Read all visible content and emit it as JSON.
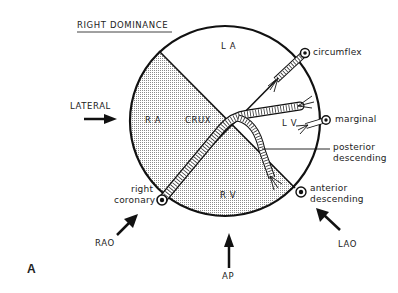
{
  "diagram": {
    "title": "RIGHT DOMINANCE",
    "figure_label": "A",
    "chambers": {
      "la": "L A",
      "ra": "R A",
      "lv": "L V",
      "rv": "R V",
      "crux": "CRUX"
    },
    "vessels": {
      "circumflex": "circumflex",
      "marginal": "marginal",
      "posterior_descending_line1": "posterior",
      "posterior_descending_line2": "descending",
      "right_coronary_line1": "right",
      "right_coronary_line2": "coronary",
      "anterior_descending_line1": "anterior",
      "anterior_descending_line2": "descending"
    },
    "views": {
      "lateral": "LATERAL",
      "rao": "RAO",
      "ap": "AP",
      "lao": "LAO"
    },
    "colors": {
      "line": "#111111",
      "shade": "#c8c8c8",
      "background": "#ffffff"
    }
  }
}
